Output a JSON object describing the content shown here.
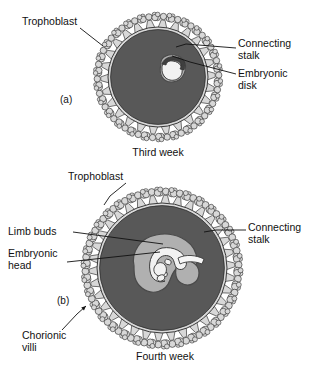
{
  "figure": {
    "background_color": "#ffffff",
    "colors": {
      "chorion_fill": "#585858",
      "villi_fill": "#d8d8d8",
      "villi_stroke": "#3a3a3a",
      "sac_fill": "#b0b0b0",
      "sac_stroke": "#4a4a4a",
      "embryo_fill": "#f2f2f2",
      "embryo_stroke": "#3a3a3a",
      "leader_line": "#111111",
      "text": "#111111"
    }
  },
  "panels": [
    {
      "id": "a",
      "panel_label": "(a)",
      "caption": "Third week",
      "center": {
        "x": 158,
        "y": 77
      },
      "radius": 50,
      "villi_outer_radius": 62,
      "villi_count": 26,
      "labels": [
        {
          "name": "trophoblast",
          "text": "Trophoblast",
          "x": 22,
          "y": 22,
          "anchor": "start"
        },
        {
          "name": "connecting-stalk",
          "text": "Connecting",
          "text2": "stalk",
          "x": 238,
          "y": 44,
          "anchor": "start"
        },
        {
          "name": "embryonic-disk",
          "text": "Embryonic",
          "text2": "disk",
          "x": 238,
          "y": 74,
          "anchor": "start"
        }
      ]
    },
    {
      "id": "b",
      "panel_label": "(b)",
      "caption": "Fourth week",
      "center": {
        "x": 162,
        "y": 268
      },
      "radius": 65,
      "villi_outer_radius": 78,
      "villi_count": 34,
      "labels": [
        {
          "name": "trophoblast",
          "text": "Trophoblast",
          "x": 68,
          "y": 177,
          "anchor": "start"
        },
        {
          "name": "limb-buds",
          "text": "Limb buds",
          "x": 8,
          "y": 232,
          "anchor": "start"
        },
        {
          "name": "embryonic-head",
          "text": "Embryonic",
          "text2": "head",
          "x": 8,
          "y": 254,
          "anchor": "start"
        },
        {
          "name": "connecting-stalk",
          "text": "Connecting",
          "text2": "stalk",
          "x": 248,
          "y": 228,
          "anchor": "start"
        },
        {
          "name": "chorionic-villi",
          "text": "Chorionic",
          "text2": "villi",
          "x": 22,
          "y": 336,
          "anchor": "start"
        }
      ]
    }
  ],
  "panel_a_label_positions": {
    "panel_label_x": 60,
    "panel_label_y": 100,
    "caption_x": 158,
    "caption_y": 153
  },
  "panel_b_label_positions": {
    "panel_label_x": 57,
    "panel_label_y": 301,
    "caption_x": 165,
    "caption_y": 357
  }
}
